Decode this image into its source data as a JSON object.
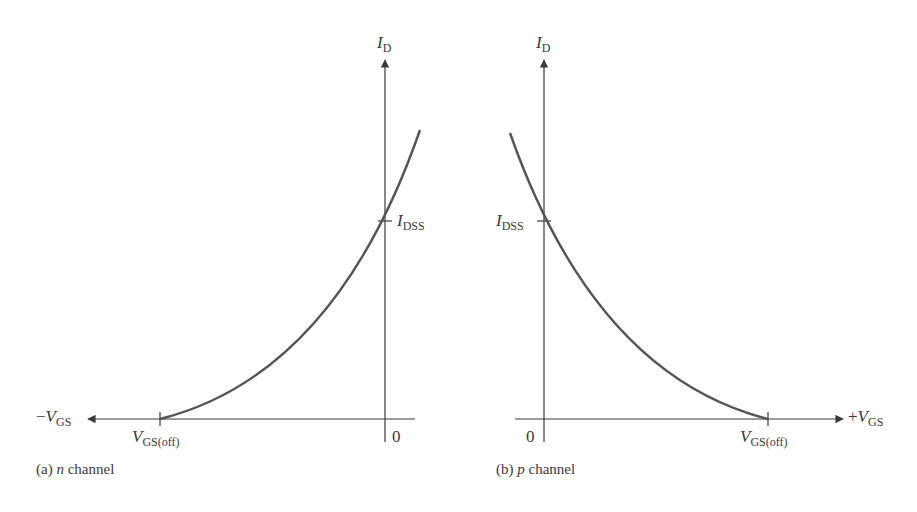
{
  "colors": {
    "axis": "#3a3a3a",
    "curve": "#555555",
    "background": "#ffffff"
  },
  "panel_a": {
    "caption_prefix": "(a) ",
    "caption_italic": "n",
    "caption_suffix": " channel",
    "y_axis_label": "I",
    "y_axis_label_sub": "D",
    "x_axis_label_sign": "−",
    "x_axis_label": "V",
    "x_axis_label_sub": "GS",
    "idss_label": "I",
    "idss_label_sub": "DSS",
    "vgsoff_label": "V",
    "vgsoff_label_sub": "GS(off)",
    "origin_label": "0"
  },
  "panel_b": {
    "caption_prefix": "(b) ",
    "caption_italic": "p",
    "caption_suffix": " channel",
    "y_axis_label": "I",
    "y_axis_label_sub": "D",
    "x_axis_label_sign": "+",
    "x_axis_label": "V",
    "x_axis_label_sub": "GS",
    "idss_label": "I",
    "idss_label_sub": "DSS",
    "vgsoff_label": "V",
    "vgsoff_label_sub": "GS(off)",
    "origin_label": "0"
  }
}
